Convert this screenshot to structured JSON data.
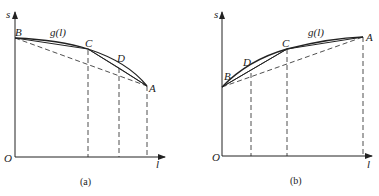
{
  "panels": [
    {
      "id": "a",
      "caption": "(a)",
      "axis": {
        "y_label": "s",
        "x_label": "l",
        "origin": "O"
      },
      "points": {
        "B": "B",
        "C": "C",
        "D": "D",
        "A": "A"
      },
      "curve_label": "g(l)"
    },
    {
      "id": "b",
      "caption": "(b)",
      "axis": {
        "y_label": "s",
        "x_label": "l",
        "origin": "O"
      },
      "points": {
        "B": "B",
        "C": "C",
        "D": "D",
        "A": "A"
      },
      "curve_label": "g(l)"
    }
  ],
  "colors": {
    "line": "#222222",
    "background": "#ffffff"
  }
}
